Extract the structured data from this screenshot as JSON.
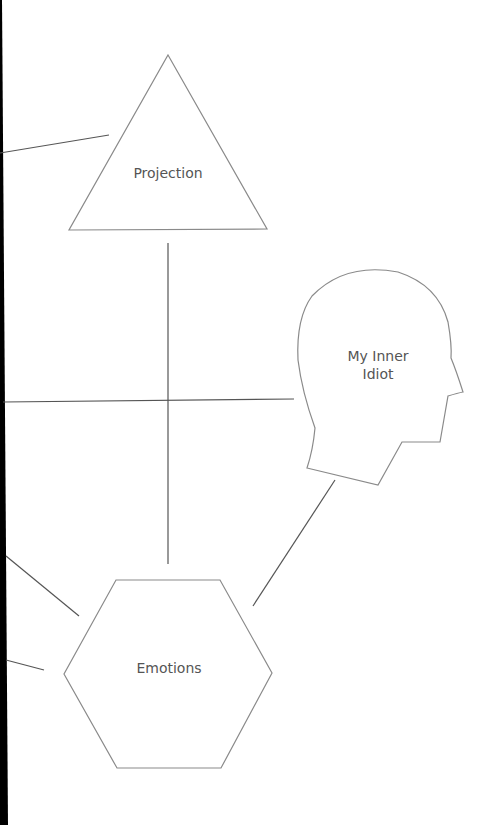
{
  "diagram": {
    "nodes": [
      {
        "id": "projection",
        "shape": "triangle",
        "label": "Projection"
      },
      {
        "id": "inner-idiot",
        "shape": "head-profile",
        "label_lines": [
          "My Inner",
          "Idiot"
        ]
      },
      {
        "id": "emotions",
        "shape": "hexagon",
        "label": "Emotions"
      }
    ],
    "colors": {
      "shape_stroke": "#8a8a8a",
      "connector": "#555555",
      "label": "#555555",
      "background": "#ffffff",
      "left_edge": "#000000"
    }
  }
}
